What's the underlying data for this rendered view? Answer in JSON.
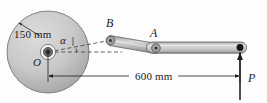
{
  "figure": {
    "background_color": "#fdfdfd",
    "line_color": "#1a1a1a"
  },
  "labels": {
    "radius": "150 mm",
    "angle": "α",
    "center": "O",
    "crank_pin": "B",
    "pin_joint": "A",
    "force": "P",
    "span": "600 mm"
  },
  "geometry": {
    "disk": {
      "center_x": 48,
      "center_y": 52,
      "radius": 41,
      "fill_light": "#d2d2d2",
      "fill_dark": "#9a9a9a",
      "edge_color": "#6f6f6f"
    },
    "hub": {
      "outer_radius": 7.5,
      "inner_radius": 3.6,
      "outer_fill": "#f2f2f2",
      "inner_fill": "#4a4a4a"
    },
    "crank_pin_B": {
      "x": 110,
      "y": 40
    },
    "pin_joint_A": {
      "x": 156,
      "y": 48
    },
    "bar_right_end": {
      "x": 244,
      "y": 47
    },
    "force_arrow": {
      "x": 240,
      "tail_y": 100,
      "head_y": 52
    },
    "dimension_line": {
      "y": 76,
      "x_start": 48,
      "x_end": 240
    },
    "member_fill_light": "#e2e2e2",
    "member_fill_mid": "#b6b6b6",
    "member_fill_dark": "#8e8e8e"
  },
  "icons": {
    "force_arrow": "arrow-up-icon",
    "dimension_arrow_left": "arrow-left-icon",
    "dimension_arrow_right": "arrow-right-icon",
    "leader_arrow": "leader-arrow-icon"
  }
}
